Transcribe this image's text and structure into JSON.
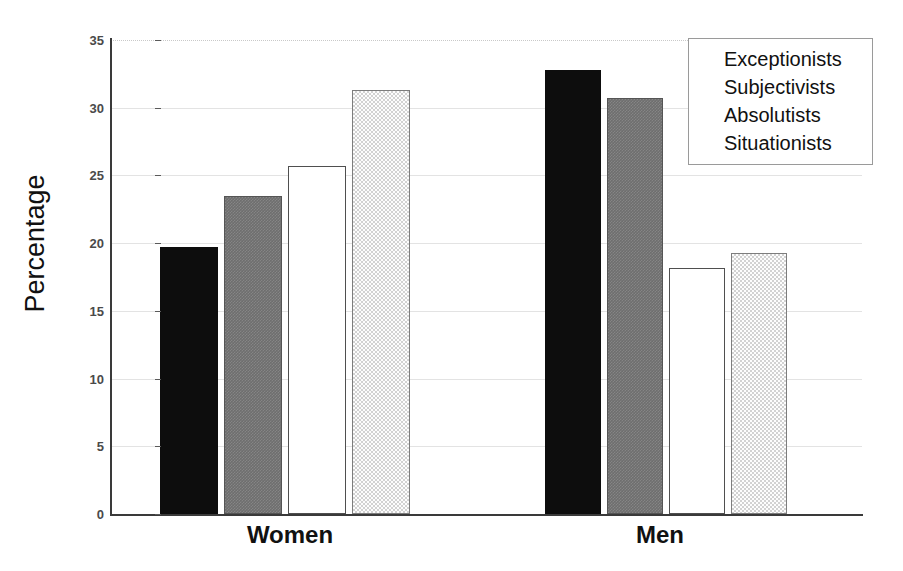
{
  "chart_data": {
    "type": "bar",
    "title": "",
    "xlabel": "",
    "ylabel": "Percentage",
    "ylim": [
      0,
      35
    ],
    "yticks": [
      0,
      5,
      10,
      15,
      20,
      25,
      30,
      35
    ],
    "grid": true,
    "legend_position": "top-right",
    "categories": [
      "Women",
      "Men"
    ],
    "series": [
      {
        "name": "Exceptionists",
        "values": [
          19.7,
          32.8
        ],
        "style": "black"
      },
      {
        "name": "Subjectivists",
        "values": [
          23.5,
          30.7
        ],
        "style": "gray"
      },
      {
        "name": "Absolutists",
        "values": [
          25.7,
          18.2
        ],
        "style": "white"
      },
      {
        "name": "Situationists",
        "values": [
          31.3,
          19.3
        ],
        "style": "dotted"
      }
    ]
  },
  "axis": {
    "y_title": "Percentage",
    "tick_labels": [
      "0",
      "5",
      "10",
      "15",
      "20",
      "25",
      "30",
      "35"
    ],
    "category_labels": [
      "Women",
      "Men"
    ]
  },
  "legend": {
    "items": [
      {
        "label": "Exceptionists",
        "swatch": "legend-swatch-black"
      },
      {
        "label": "Subjectivists",
        "swatch": "legend-swatch-gray"
      },
      {
        "label": "Absolutists",
        "swatch": "legend-swatch-white"
      },
      {
        "label": "Situationists",
        "swatch": "legend-swatch-dotted"
      }
    ]
  },
  "colors": {
    "black": "#0d0d0d",
    "gray": "#6e6e6e",
    "white": "#ffffff",
    "dotted": "#d2d2d2",
    "axis": "#3a3a3a",
    "grid": "#e3e3e3",
    "text": "#111111"
  }
}
